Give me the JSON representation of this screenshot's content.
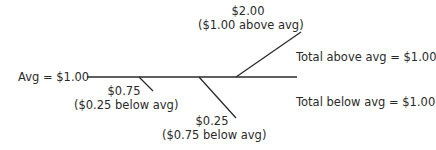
{
  "diagram": {
    "average_label": "Avg = $1.00",
    "points": [
      {
        "value": "$0.75",
        "diff": "($0.25 below avg)"
      },
      {
        "value": "$0.25",
        "diff": "($0.75 below avg)"
      },
      {
        "value": "$2.00",
        "diff": "($1.00 above avg)"
      }
    ],
    "total_above": "Total above avg = $1.00",
    "total_below": "Total below avg = $1.00",
    "line_color": "#2a2a2a"
  }
}
